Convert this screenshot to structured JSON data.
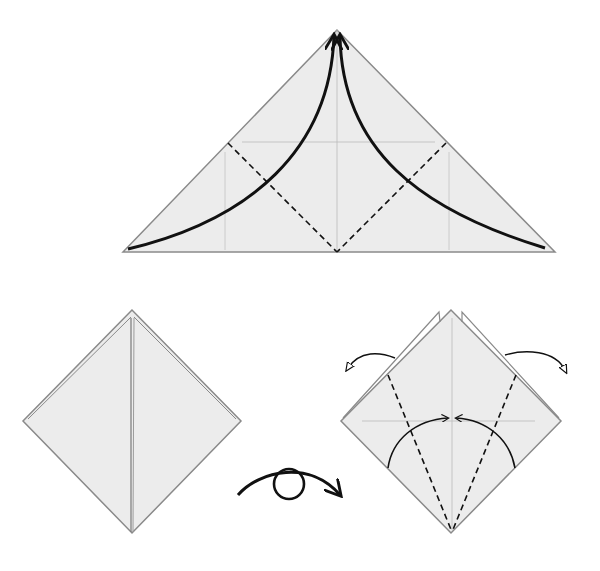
{
  "diagram": {
    "type": "origami-instructions",
    "colors": {
      "paper": "#ececec",
      "edge": "#8a8a8a",
      "crease": "#b8b8b8",
      "ink": "#111111"
    },
    "steps": [
      {
        "id": "step-1",
        "description": "Triangle base with two valley-fold dashed lines; both lower corners fold up to the apex"
      },
      {
        "id": "step-2",
        "description": "Resulting square diamond with center vertical flap line"
      },
      {
        "id": "turn-over",
        "description": "Turn model over symbol"
      },
      {
        "id": "step-3",
        "description": "Diamond with two valley folds from bottom, side flaps swing outward, edges fold to center"
      }
    ]
  }
}
